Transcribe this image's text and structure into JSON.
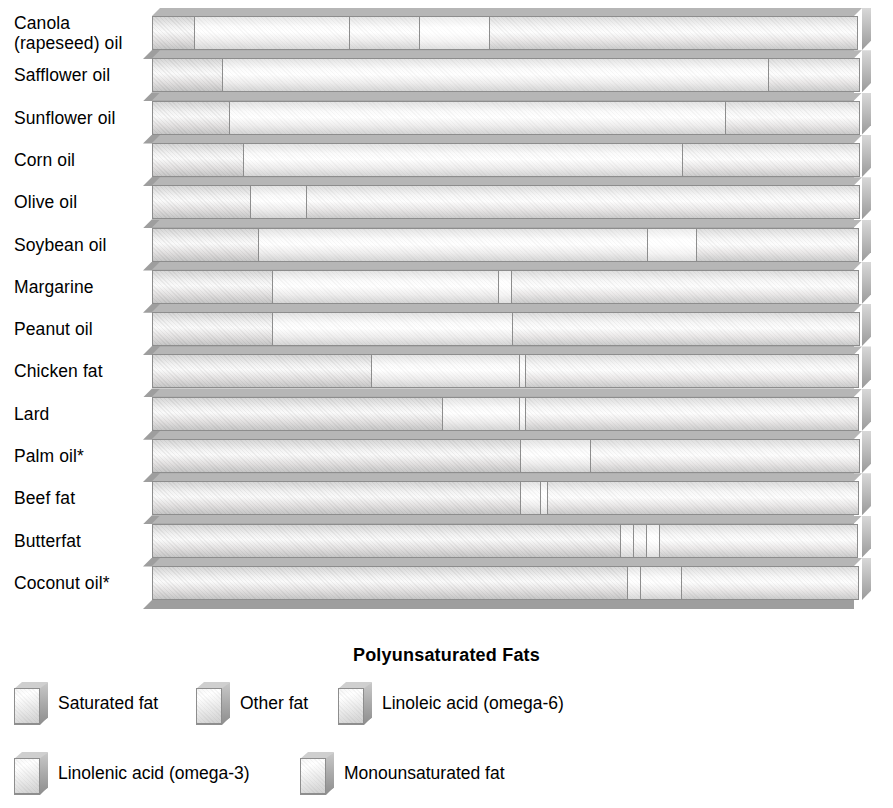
{
  "chart_data": {
    "type": "bar",
    "subtype": "stacked-horizontal-3d",
    "title": "Polyunsaturated Fats",
    "xlabel": "",
    "ylabel": "",
    "xlim": [
      0,
      100
    ],
    "grid": false,
    "units": "percent of total fat",
    "legend_position": "bottom",
    "categories": [
      "Canola (rapeseed) oil",
      "Safflower oil",
      "Sunflower oil",
      "Corn oil",
      "Olive oil",
      "Soybean oil",
      "Margarine",
      "Peanut oil",
      "Chicken fat",
      "Lard",
      "Palm oil*",
      "Beef fat",
      "Butterfat",
      "Coconut oil*"
    ],
    "series": [
      {
        "name": "Saturated fat",
        "key": "sat",
        "values": [
          6,
          10,
          11,
          13,
          14,
          15,
          17,
          17,
          31,
          41,
          52,
          52,
          66,
          67
        ]
      },
      {
        "name": "Other fat",
        "key": "other",
        "values": [
          22,
          0,
          0,
          0,
          0,
          0,
          0,
          0,
          0,
          0,
          0,
          0,
          2,
          2
        ]
      },
      {
        "name": "Linoleic acid (omega-6)",
        "key": "la",
        "values": [
          10,
          77,
          70,
          62,
          8,
          55,
          32,
          34,
          21,
          11,
          10,
          3,
          2,
          6
        ]
      },
      {
        "name": "Linolenic acid (omega-3)",
        "key": "ala",
        "values": [
          10,
          0,
          0,
          0,
          0,
          7,
          2,
          0,
          1,
          1,
          0,
          1,
          2,
          0
        ]
      },
      {
        "name": "Monounsaturated fat",
        "key": "mufa",
        "values": [
          52,
          13,
          19,
          25,
          78,
          23,
          49,
          49,
          47,
          47,
          38,
          44,
          28,
          25
        ]
      }
    ],
    "legend": [
      {
        "label": "Saturated fat",
        "key": "sat"
      },
      {
        "label": "Other fat",
        "key": "other"
      },
      {
        "label": "Linoleic acid (omega-6)",
        "key": "la"
      },
      {
        "label": "Linolenic acid (omega-3)",
        "key": "ala"
      },
      {
        "label": "Monounsaturated fat",
        "key": "mufa"
      }
    ],
    "footnote_marker": "*",
    "colors": {
      "bar_face_light": "#ffffff",
      "bar_face_shade": "#d2d2d2",
      "bar_outline": "#8d8d8d",
      "bar_top": "#b6b6b6",
      "bar_shadow": "#9e9e9e",
      "text": "#000000",
      "background": "#ffffff"
    }
  },
  "rows": [
    {
      "label_lines": [
        "Canola",
        "(rapeseed) oil"
      ]
    },
    {
      "label_lines": [
        "Safflower oil"
      ]
    },
    {
      "label_lines": [
        "Sunflower oil"
      ]
    },
    {
      "label_lines": [
        "Corn oil"
      ]
    },
    {
      "label_lines": [
        "Olive oil"
      ]
    },
    {
      "label_lines": [
        "Soybean oil"
      ]
    },
    {
      "label_lines": [
        "Margarine"
      ]
    },
    {
      "label_lines": [
        "Peanut oil"
      ]
    },
    {
      "label_lines": [
        "Chicken fat"
      ]
    },
    {
      "label_lines": [
        "Lard"
      ]
    },
    {
      "label_lines": [
        "Palm oil*"
      ]
    },
    {
      "label_lines": [
        "Beef fat"
      ]
    },
    {
      "label_lines": [
        "Butterfat"
      ]
    },
    {
      "label_lines": [
        "Coconut oil*"
      ]
    }
  ]
}
